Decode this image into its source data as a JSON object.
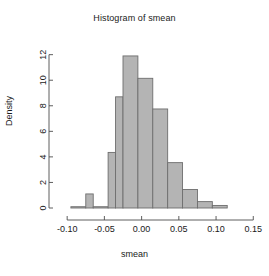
{
  "chart_data": {
    "type": "bar",
    "title": "Histogram of smean",
    "xlabel": "smean",
    "ylabel": "Density",
    "grid": false,
    "legend": null,
    "xlim": [
      -0.115,
      0.155
    ],
    "ylim": [
      0,
      12.6
    ],
    "xticks": [
      -0.1,
      -0.05,
      0.0,
      0.05,
      0.1,
      0.15
    ],
    "xtick_labels": [
      "-0.10",
      "-0.05",
      "0.00",
      "0.05",
      "0.10",
      "0.15"
    ],
    "yticks": [
      0,
      2,
      4,
      6,
      8,
      10,
      12
    ],
    "ytick_labels": [
      "0",
      "2",
      "4",
      "6",
      "8",
      "10",
      "12"
    ],
    "bin_width": 0.01,
    "bin_edges": [
      -0.095,
      -0.085,
      -0.075,
      -0.065,
      -0.055,
      -0.045,
      -0.035,
      -0.025,
      -0.015,
      -0.005,
      0.005,
      0.015,
      0.025,
      0.035,
      0.045,
      0.055,
      0.065,
      0.075,
      0.085,
      0.095,
      0.105,
      0.115,
      0.125
    ],
    "bars": [
      {
        "x0": -0.095,
        "x1": -0.075,
        "density": 0.1
      },
      {
        "x0": -0.075,
        "x1": -0.065,
        "density": 1.1
      },
      {
        "x0": -0.065,
        "x1": -0.045,
        "density": 0.1
      },
      {
        "x0": -0.045,
        "x1": -0.035,
        "density": 4.35
      },
      {
        "x0": -0.035,
        "x1": -0.025,
        "density": 8.7
      },
      {
        "x0": -0.025,
        "x1": -0.005,
        "density": 11.9
      },
      {
        "x0": -0.005,
        "x1": 0.015,
        "density": 10.15
      },
      {
        "x0": 0.015,
        "x1": 0.035,
        "density": 7.75
      },
      {
        "x0": 0.035,
        "x1": 0.055,
        "density": 3.55
      },
      {
        "x0": 0.055,
        "x1": 0.075,
        "density": 1.45
      },
      {
        "x0": 0.075,
        "x1": 0.095,
        "density": 0.5
      },
      {
        "x0": 0.095,
        "x1": 0.115,
        "density": 0.2
      }
    ],
    "categories": [
      "-0.095",
      "-0.085",
      "-0.075",
      "-0.065",
      "-0.055",
      "-0.045",
      "-0.035",
      "-0.025",
      "-0.015",
      "-0.005",
      "0.005",
      "0.015",
      "0.025",
      "0.035",
      "0.045",
      "0.055",
      "0.065",
      "0.075",
      "0.085",
      "0.095",
      "0.105",
      "0.115"
    ],
    "values": [
      0.1,
      0.1,
      1.1,
      0.1,
      0.1,
      4.35,
      8.7,
      11.9,
      11.9,
      10.15,
      10.15,
      7.75,
      7.75,
      3.55,
      3.55,
      1.45,
      1.45,
      0.5,
      0.5,
      0.2,
      0.2,
      0.0
    ],
    "colors": {
      "bar_fill": "#b4b4b4",
      "bar_border": "#6e6e6e",
      "axis": "#4d4d4d",
      "text": "#1a1a1a",
      "background": "#ffffff"
    }
  }
}
